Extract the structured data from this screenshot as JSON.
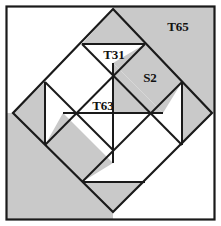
{
  "figure": {
    "canvas": {
      "width": 221,
      "height": 226
    },
    "colors": {
      "shaded": "#c9c9c9",
      "unshaded": "#ffffff",
      "stroke": "#1a1a1a",
      "frame": "#1a1a1a",
      "label": "#111111",
      "background": "#ffffff"
    },
    "frame": {
      "x": 6,
      "y": 6,
      "width": 209,
      "height": 214
    },
    "diamond": {
      "top": [
        113,
        9
      ],
      "right": [
        212,
        113
      ],
      "bottom": [
        113,
        212
      ],
      "left": [
        13,
        113
      ]
    },
    "labels": [
      {
        "id": "t65",
        "text": "T65",
        "x": 178,
        "y": 31
      },
      {
        "id": "t31",
        "text": "T31",
        "x": 114,
        "y": 59
      },
      {
        "id": "s2",
        "text": "S2",
        "x": 150,
        "y": 82
      },
      {
        "id": "t63",
        "text": "T63",
        "x": 103,
        "y": 110
      }
    ],
    "shaded_regions": [
      {
        "id": "corner-top-right",
        "points": "113,9 212,113 215,113 215,6 113,6"
      },
      {
        "id": "corner-bottom-left",
        "points": "13,113 113,212 6,212 6,113"
      },
      {
        "id": "corner-bottom-left-fill",
        "points": "6,113 13,113 113,212 6,212"
      },
      {
        "id": "wedge-top-right",
        "points": "113,9 145,44 82,44"
      },
      {
        "id": "quad-s2",
        "points": "113,63 163,113 145,113 113,82"
      },
      {
        "id": "s2-block",
        "points": "113,63 145,44 182,82 163,113"
      },
      {
        "id": "tri-left-upper",
        "points": "45,82 45,145 13,113"
      },
      {
        "id": "tri-right-lower",
        "points": "182,82 182,145 212,113"
      },
      {
        "id": "tri-center-upper",
        "points": "113,63 163,113 113,113"
      },
      {
        "id": "tri-bottom-left",
        "points": "63,113 113,163 82,182 45,145"
      },
      {
        "id": "wedge-bottom",
        "points": "82,182 145,182 113,212"
      },
      {
        "id": "tri-center-left",
        "points": "63,113 113,113 113,163"
      }
    ],
    "lines": [
      {
        "id": "diamond-top-left",
        "from": [
          13,
          113
        ],
        "to": [
          113,
          9
        ]
      },
      {
        "id": "diamond-top-right",
        "from": [
          113,
          9
        ],
        "to": [
          212,
          113
        ]
      },
      {
        "id": "diamond-bottom-right",
        "from": [
          212,
          113
        ],
        "to": [
          113,
          212
        ]
      },
      {
        "id": "diamond-bottom-left",
        "from": [
          113,
          212
        ],
        "to": [
          13,
          113
        ]
      },
      {
        "id": "inner-top-left",
        "from": [
          45,
          82
        ],
        "to": [
          113,
          150
        ]
      },
      {
        "id": "inner-upper-right",
        "from": [
          82,
          44
        ],
        "to": [
          182,
          145
        ]
      },
      {
        "id": "inner-lower-left",
        "from": [
          45,
          145
        ],
        "to": [
          145,
          44
        ]
      },
      {
        "id": "inner-bottom-right",
        "from": [
          82,
          182
        ],
        "to": [
          182,
          82
        ]
      },
      {
        "id": "chord-top",
        "from": [
          82,
          44
        ],
        "to": [
          145,
          44
        ]
      },
      {
        "id": "chord-bottom",
        "from": [
          82,
          182
        ],
        "to": [
          145,
          182
        ]
      },
      {
        "id": "chord-left",
        "from": [
          45,
          82
        ],
        "to": [
          45,
          145
        ]
      },
      {
        "id": "chord-right",
        "from": [
          182,
          82
        ],
        "to": [
          182,
          145
        ]
      },
      {
        "id": "center-horizontal",
        "from": [
          63,
          113
        ],
        "to": [
          163,
          113
        ]
      },
      {
        "id": "center-vertical",
        "from": [
          113,
          63
        ],
        "to": [
          113,
          163
        ]
      }
    ]
  }
}
